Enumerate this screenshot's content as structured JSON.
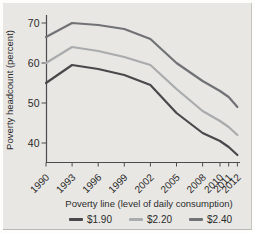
{
  "figure": {
    "panel_bg": "#e8e7e4",
    "axis_color": "#4b4b4d",
    "text_color": "#2b2b2b"
  },
  "chart_data": {
    "type": "line",
    "ylabel": "Poverty headcount (percent)",
    "xlabel": "Poverty line (level of daily consumption)",
    "x": [
      1990,
      1993,
      1996,
      1999,
      2002,
      2005,
      2008,
      2010,
      2011,
      2012
    ],
    "x_tick_labels": [
      "1990",
      "1993",
      "1996",
      "1999",
      "2002",
      "2005",
      "2008",
      "2010",
      "2011",
      "2012"
    ],
    "y_ticks": [
      40,
      50,
      60,
      70
    ],
    "xlim": [
      1990,
      2012
    ],
    "ylim": [
      35,
      72
    ],
    "grid": false,
    "legend_position": "bottom",
    "series": [
      {
        "name": "$1.90",
        "color": "#49494b",
        "values": [
          55,
          59.5,
          58.5,
          57,
          54.5,
          47.5,
          42.5,
          40.5,
          39,
          37
        ]
      },
      {
        "name": "$2.20",
        "color": "#a9abad",
        "values": [
          60,
          64,
          63,
          61.5,
          59.5,
          53.5,
          48,
          45.5,
          44,
          42
        ]
      },
      {
        "name": "$2.40",
        "color": "#717275",
        "values": [
          66.5,
          70,
          69.5,
          68.5,
          66,
          60,
          55.5,
          53,
          51.5,
          49
        ]
      }
    ]
  }
}
